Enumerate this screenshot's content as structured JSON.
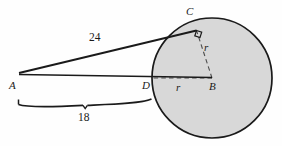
{
  "figure": {
    "kind": "geometry-diagram",
    "canvas": {
      "width": 282,
      "height": 146
    },
    "background_color": "#fefefe",
    "stroke_color": "#1a1a1a",
    "circle_fill_color": "#d8d8d8",
    "dashed_color": "#5a5a5a"
  },
  "points": {
    "A": {
      "label": "A",
      "x": 19,
      "y": 73
    },
    "B": {
      "label": "B",
      "x": 212,
      "y": 78
    },
    "C": {
      "label": "C",
      "x": 195,
      "y": 30
    },
    "D": {
      "label": "D",
      "x": 152,
      "y": 76
    }
  },
  "circle": {
    "center_x": 212,
    "center_y": 78,
    "radius": 60
  },
  "segments": {
    "tangent_AC": {
      "label": "24",
      "from": "A",
      "to": "C"
    },
    "base_AB": {
      "from": "A",
      "to": "B"
    },
    "radius_BC": {
      "label": "r",
      "style": "dashed"
    },
    "radius_BD": {
      "label": "r",
      "style": "dashed"
    }
  },
  "measures": {
    "tangent_length": "24",
    "brace_length": "18"
  },
  "brace": {
    "label": "18",
    "left_x": 18,
    "right_x": 152,
    "y": 106,
    "notch_x": 85
  },
  "markers": {
    "right_angle_at_C": "right-angle-square"
  }
}
